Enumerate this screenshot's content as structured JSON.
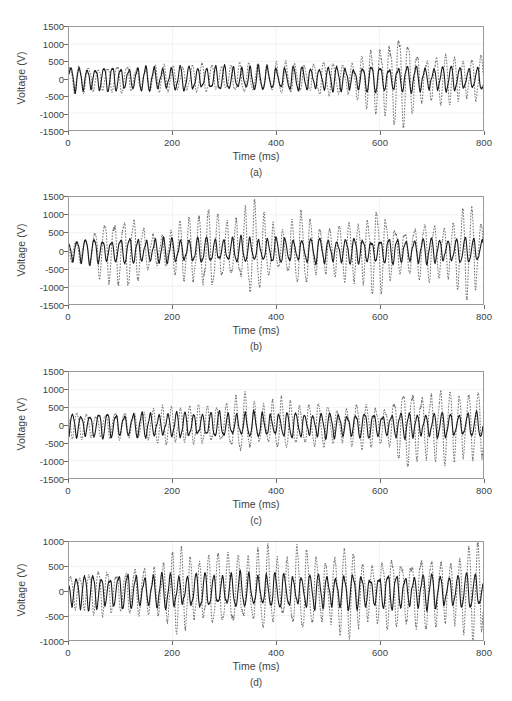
{
  "figure": {
    "panel_count": 4,
    "background_color": "#ffffff",
    "axis_color": "#9a9a9a",
    "text_color": "#3f3f3f"
  },
  "chart_data": [
    {
      "type": "line",
      "panel_label": "(a)",
      "title": "",
      "xlabel": "Time (ms)",
      "ylabel": "Voltage (V)",
      "xlim": [
        0,
        800
      ],
      "ylim": [
        -1500,
        1500
      ],
      "xticks": [
        0,
        200,
        400,
        600,
        800
      ],
      "yticks": [
        -1500,
        -1000,
        -500,
        0,
        500,
        1000,
        1500
      ],
      "xticklabels": [
        "0",
        "200",
        "400",
        "600",
        "800"
      ],
      "yticklabels": [
        "-1500",
        "-1000",
        "-500",
        "0",
        "500",
        "1000",
        "1500"
      ],
      "grid": true,
      "legend": null,
      "series": [
        {
          "name": "reference-voltage",
          "style": "solid",
          "color": "#1a1a1a",
          "width": 1.1,
          "description": "Steady sinusoidal carrier, near-constant amplitude ~300 V across the whole record",
          "base_amplitude": 300,
          "base_frequency_hz": 60,
          "envelope_x": [
            0,
            100,
            200,
            300,
            400,
            500,
            560,
            600,
            640,
            700,
            800
          ],
          "envelope_y": [
            300,
            300,
            300,
            300,
            300,
            300,
            310,
            330,
            330,
            315,
            300
          ]
        },
        {
          "name": "measured-voltage",
          "style": "dotted",
          "color": "#6e6e6e",
          "width": 1.0,
          "description": "Secondary trace, modest amplitude until ~560 ms then a strong burst peaking near 1250 V around 630 ms, decaying to ~600 V by 800 ms",
          "base_amplitude": 330,
          "base_frequency_hz": 55,
          "envelope_x": [
            0,
            80,
            160,
            240,
            320,
            400,
            460,
            520,
            560,
            580,
            600,
            615,
            630,
            645,
            660,
            680,
            700,
            730,
            760,
            800
          ],
          "envelope_y": [
            330,
            340,
            330,
            350,
            360,
            380,
            400,
            420,
            520,
            700,
            950,
            1150,
            1250,
            1150,
            900,
            700,
            620,
            600,
            580,
            600
          ]
        }
      ]
    },
    {
      "type": "line",
      "panel_label": "(b)",
      "title": "",
      "xlabel": "Time (ms)",
      "ylabel": "Voltage (V)",
      "xlim": [
        0,
        800
      ],
      "ylim": [
        -1500,
        1500
      ],
      "xticks": [
        0,
        200,
        400,
        600,
        800
      ],
      "yticks": [
        -1500,
        -1000,
        -500,
        0,
        500,
        1000,
        1500
      ],
      "xticklabels": [
        "0",
        "200",
        "400",
        "600",
        "800"
      ],
      "yticklabels": [
        "-1500",
        "-1000",
        "-500",
        "0",
        "500",
        "1000",
        "1500"
      ],
      "grid": true,
      "legend": null,
      "series": [
        {
          "name": "reference-voltage",
          "style": "solid",
          "color": "#1a1a1a",
          "width": 1.1,
          "description": "Steady sinusoidal carrier, near-constant amplitude ~300 V",
          "base_amplitude": 300,
          "base_frequency_hz": 60,
          "envelope_x": [
            0,
            200,
            400,
            600,
            800
          ],
          "envelope_y": [
            300,
            300,
            300,
            300,
            300
          ]
        },
        {
          "name": "measured-voltage",
          "style": "dotted",
          "color": "#6e6e6e",
          "width": 1.0,
          "description": "Irregular bursts throughout the record; first burst near 100 ms (~1000 V), largest near 265-350 ms (~1250 V), further bursts near 590 and 775 ms (~1150 V)",
          "base_amplitude": 330,
          "base_frequency_hz": 55,
          "envelope_x": [
            0,
            40,
            70,
            95,
            115,
            150,
            190,
            225,
            265,
            300,
            330,
            350,
            375,
            410,
            450,
            480,
            520,
            560,
            590,
            620,
            660,
            700,
            740,
            775,
            800
          ],
          "envelope_y": [
            300,
            330,
            760,
            1000,
            900,
            480,
            430,
            760,
            1150,
            620,
            950,
            1250,
            820,
            560,
            900,
            700,
            600,
            820,
            1100,
            700,
            620,
            700,
            780,
            1150,
            760
          ]
        }
      ]
    },
    {
      "type": "line",
      "panel_label": "(c)",
      "title": "",
      "xlabel": "Time (ms)",
      "ylabel": "Voltage (V)",
      "xlim": [
        0,
        800
      ],
      "ylim": [
        -1500,
        1500
      ],
      "xticks": [
        0,
        200,
        400,
        600,
        800
      ],
      "yticks": [
        -1500,
        -1000,
        -500,
        0,
        500,
        1000,
        1500
      ],
      "xticklabels": [
        "0",
        "200",
        "400",
        "600",
        "800"
      ],
      "yticklabels": [
        "-1500",
        "-1000",
        "-500",
        "0",
        "500",
        "1000",
        "1500"
      ],
      "grid": true,
      "legend": null,
      "series": [
        {
          "name": "reference-voltage",
          "style": "solid",
          "color": "#1a1a1a",
          "width": 1.1,
          "description": "Steady sinusoidal carrier, near-constant amplitude ~300 V",
          "base_amplitude": 300,
          "base_frequency_hz": 60,
          "envelope_x": [
            0,
            200,
            400,
            600,
            800
          ],
          "envelope_y": [
            300,
            300,
            300,
            300,
            300
          ]
        },
        {
          "name": "measured-voltage",
          "style": "dotted",
          "color": "#6e6e6e",
          "width": 1.0,
          "description": "Low amplitude (~350 V) until ~200 ms, growing moderately to ~700 V mid-record, then strong bursts after 650 ms peaking near 1000 V",
          "base_amplitude": 320,
          "base_frequency_hz": 55,
          "envelope_x": [
            0,
            60,
            120,
            170,
            210,
            260,
            300,
            340,
            380,
            420,
            470,
            520,
            570,
            620,
            655,
            680,
            710,
            740,
            770,
            800
          ],
          "envelope_y": [
            300,
            320,
            340,
            420,
            520,
            460,
            560,
            720,
            520,
            620,
            540,
            480,
            520,
            560,
            980,
            1000,
            820,
            900,
            950,
            760
          ]
        }
      ]
    },
    {
      "type": "line",
      "panel_label": "(d)",
      "title": "",
      "xlabel": "Time (ms)",
      "ylabel": "Voltage (V)",
      "xlim": [
        0,
        800
      ],
      "ylim": [
        -1000,
        1000
      ],
      "xticks": [
        0,
        200,
        400,
        600,
        800
      ],
      "yticks": [
        -1000,
        -500,
        0,
        500,
        1000
      ],
      "xticklabels": [
        "0",
        "200",
        "400",
        "600",
        "800"
      ],
      "yticklabels": [
        "-1000",
        "-500",
        "0",
        "500",
        "1000"
      ],
      "grid": true,
      "legend": null,
      "series": [
        {
          "name": "reference-voltage",
          "style": "solid",
          "color": "#1a1a1a",
          "width": 1.1,
          "description": "Steady sinusoidal carrier, near-constant amplitude ~300 V",
          "base_amplitude": 300,
          "base_frequency_hz": 60,
          "envelope_x": [
            0,
            200,
            400,
            600,
            800
          ],
          "envelope_y": [
            300,
            300,
            300,
            300,
            300
          ]
        },
        {
          "name": "measured-voltage",
          "style": "dotted",
          "color": "#6e6e6e",
          "width": 1.0,
          "description": "Dense repeated bursts across the whole record reaching 600-750 V, with the largest excursion ~900 V near 790 ms",
          "base_amplitude": 330,
          "base_frequency_hz": 55,
          "envelope_x": [
            0,
            50,
            100,
            150,
            190,
            210,
            240,
            270,
            300,
            320,
            350,
            380,
            410,
            440,
            470,
            500,
            540,
            570,
            600,
            640,
            670,
            700,
            730,
            760,
            790,
            800
          ],
          "envelope_y": [
            320,
            380,
            420,
            400,
            640,
            740,
            600,
            690,
            560,
            740,
            620,
            700,
            560,
            800,
            600,
            700,
            760,
            600,
            560,
            620,
            740,
            560,
            620,
            700,
            900,
            700
          ]
        }
      ]
    }
  ]
}
